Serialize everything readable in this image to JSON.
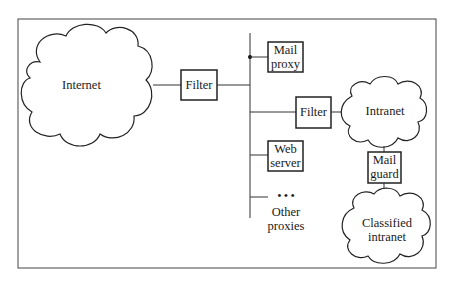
{
  "diagram": {
    "clouds": {
      "internet": "Internet",
      "intranet": "Intranet",
      "classified_line1": "Classified",
      "classified_line2": "intranet"
    },
    "boxes": {
      "filter_outer": "Filter",
      "mail_proxy_line1": "Mail",
      "mail_proxy_line2": "proxy",
      "filter_inner": "Filter",
      "web_server_line1": "Web",
      "web_server_line2": "server",
      "mail_guard_line1": "Mail",
      "mail_guard_line2": "guard"
    },
    "other": {
      "dots": "• • •",
      "other_proxies_line1": "Other",
      "other_proxies_line2": "proxies"
    },
    "colors": {
      "stroke": "#222222",
      "background": "#ffffff"
    }
  }
}
